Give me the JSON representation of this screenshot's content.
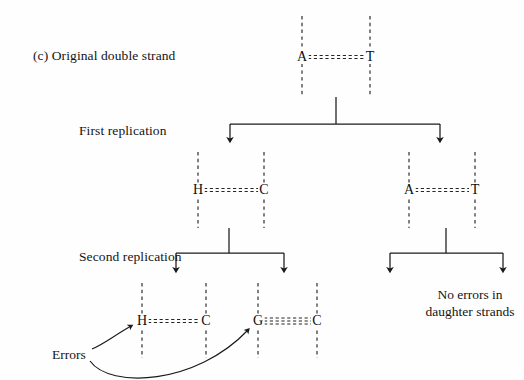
{
  "figure": {
    "panel_label": "(c)",
    "panel_title": "Original double strand",
    "width": 524,
    "height": 380,
    "background_color": "#fefefe",
    "line_color": "#1a1a1a"
  },
  "stages": [
    {
      "id": "original",
      "label": "(c)  Original double strand",
      "x": 33,
      "y": 48
    },
    {
      "id": "first",
      "label": "First replication",
      "x": 79,
      "y": 123
    },
    {
      "id": "second",
      "label": "Second replication",
      "x": 79,
      "y": 249
    }
  ],
  "notes": [
    {
      "id": "no-errors",
      "line1": "No errors in",
      "line2": "daughter strands",
      "x": 470,
      "y": 286
    }
  ],
  "annotations": [
    {
      "id": "errors",
      "label": "Errors",
      "x": 52,
      "y": 355
    }
  ],
  "base_pairs": [
    {
      "id": "original-at",
      "generation": 0,
      "left_base": "A",
      "right_base": "T",
      "left_x": 302,
      "right_x": 370,
      "y": 57,
      "strand_top": 16,
      "strand_bottom": 97,
      "bond_count": 2
    },
    {
      "id": "gen1-left-hc",
      "generation": 1,
      "left_base": "H",
      "right_base": "C",
      "left_x": 198,
      "right_x": 264,
      "y": 190,
      "strand_top": 152,
      "strand_bottom": 228,
      "bond_count": 2
    },
    {
      "id": "gen1-right-at",
      "generation": 1,
      "left_base": "A",
      "right_base": "T",
      "left_x": 409,
      "right_x": 475,
      "y": 190,
      "strand_top": 152,
      "strand_bottom": 228,
      "bond_count": 2
    },
    {
      "id": "gen2-hc",
      "generation": 2,
      "left_base": "H",
      "right_base": "C",
      "left_x": 142,
      "right_x": 206,
      "y": 321,
      "strand_top": 283,
      "strand_bottom": 358,
      "bond_count": 2
    },
    {
      "id": "gen2-gc",
      "generation": 2,
      "left_base": "G",
      "right_base": "C",
      "left_x": 258,
      "right_x": 317,
      "y": 321,
      "strand_top": 283,
      "strand_bottom": 358,
      "bond_count": 3
    }
  ],
  "branches": [
    {
      "id": "first-replication-split",
      "stem_x": 336,
      "stem_top": 97,
      "bar_y": 124,
      "bar_left": 230,
      "bar_right": 440,
      "arrow_tip_y": 147
    },
    {
      "id": "second-replication-split-left",
      "stem_x": 229,
      "stem_top": 228,
      "bar_y": 253,
      "bar_left": 176,
      "bar_right": 284,
      "arrow_tip_y": 277
    },
    {
      "id": "second-replication-split-right",
      "stem_x": 446,
      "stem_top": 228,
      "bar_y": 253,
      "bar_left": 390,
      "bar_right": 503,
      "arrow_tip_y": 277
    }
  ],
  "error_arrows": [
    {
      "id": "error-arrow-to-h",
      "target_base": "H",
      "path": "M 92 349 C 104 344 112 337 131 326"
    },
    {
      "id": "error-arrow-to-g",
      "target_base": "G",
      "path": "M 90 361 C 110 389 196 385 248 330"
    }
  ]
}
